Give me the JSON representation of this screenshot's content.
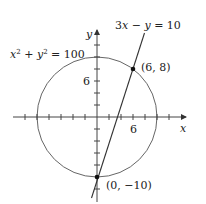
{
  "diagram": {
    "axes": {
      "x_label": "x",
      "y_label": "y",
      "x_tick_label": "6",
      "y_tick_label": "6",
      "tick_spacing_units": 2
    },
    "circle": {
      "equation_lhs": "x",
      "equation_mid": " + y",
      "equation_rhs": " = 100",
      "sup": "2",
      "center": [
        0,
        0
      ],
      "radius": 10
    },
    "line": {
      "equation": "3x − y = 10",
      "eq_part1": "3",
      "eq_x": "x",
      "eq_part2": " − ",
      "eq_y": "y",
      "eq_part3": " = 10"
    },
    "points": [
      {
        "label": "(6, 8)",
        "x": 6,
        "y": 8
      },
      {
        "label": "(0, −10)",
        "x": 0,
        "y": -10
      }
    ],
    "colors": {
      "stroke": "#555555",
      "axis": "#444444",
      "point": "#111111"
    }
  }
}
